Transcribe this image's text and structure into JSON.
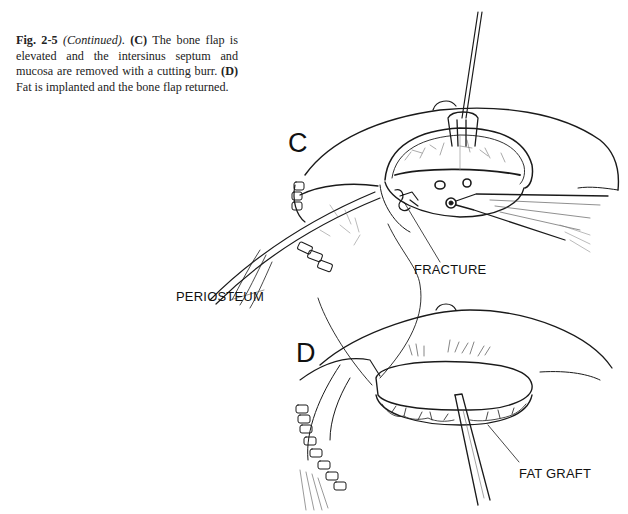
{
  "caption": {
    "figure_number": "Fig. 2-5",
    "continued": "(Continued)",
    "period": ". ",
    "panel_c_label": "(C)",
    "panel_c_text": " The bone flap is elevated and the intersinus septum and mucosa are removed with a cutting burr. ",
    "panel_d_label": "(D)",
    "panel_d_text": " Fat is implanted and the bone flap returned."
  },
  "figure": {
    "panels": [
      {
        "letter": "C",
        "callouts": [
          "FRACTURE",
          "PERIOSTEUM"
        ]
      },
      {
        "letter": "D",
        "callouts": [
          "FAT GRAFT"
        ]
      }
    ]
  },
  "labels": {
    "panel_c": "C",
    "panel_d": "D",
    "fracture": "FRACTURE",
    "periosteum": "PERIOSTEUM",
    "fat_graft": "FAT GRAFT"
  }
}
